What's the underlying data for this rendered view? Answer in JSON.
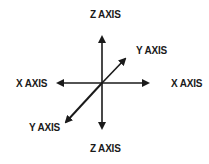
{
  "diagram": {
    "type": "3d-axes",
    "labels": {
      "z_top": "Z AXIS",
      "z_bottom": "Z AXIS",
      "x_left": "X AXIS",
      "x_right": "X AXIS",
      "y_top_right": "Y AXIS",
      "y_bottom_left": "Y AXIS"
    },
    "colors": {
      "stroke": "#1a1a1a",
      "background": "#ffffff"
    }
  }
}
